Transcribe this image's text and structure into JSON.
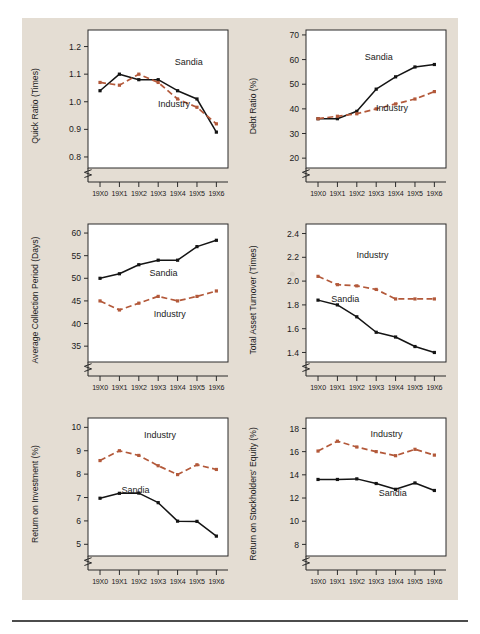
{
  "page": {
    "background_color": "#e4ddd3",
    "series_colors": {
      "sandia": "#141414",
      "industry": "#b3593a"
    },
    "series_names": {
      "sandia": "Sandia",
      "industry": "Industry"
    },
    "x_categories": [
      "19X0",
      "19X1",
      "19X2",
      "19X3",
      "19X4",
      "19X5",
      "19X6"
    ]
  },
  "chart_data": [
    {
      "id": "quick-ratio",
      "type": "line",
      "title": "",
      "xlabel": "",
      "ylabel": "Quick Ratio (Times)",
      "categories": [
        "19X0",
        "19X1",
        "19X2",
        "19X3",
        "19X4",
        "19X5",
        "19X6"
      ],
      "yticks": [
        0.8,
        0.9,
        1.0,
        1.1,
        1.2
      ],
      "ytick_labels": [
        "0.8",
        "0.9",
        "1.0",
        "1.1",
        "1.2"
      ],
      "ylim": [
        0.76,
        1.26
      ],
      "grid": false,
      "axis_break": true,
      "legend": "inline-annotation",
      "series": [
        {
          "name": "Sandia",
          "values": [
            1.04,
            1.1,
            1.08,
            1.08,
            1.04,
            1.01,
            0.89
          ]
        },
        {
          "name": "Industry",
          "values": [
            1.07,
            1.06,
            1.1,
            1.07,
            1.01,
            0.98,
            0.92
          ]
        }
      ]
    },
    {
      "id": "debt-ratio",
      "type": "line",
      "title": "",
      "xlabel": "",
      "ylabel": "Debt Ratio (%)",
      "categories": [
        "19X0",
        "19X1",
        "19X2",
        "19X3",
        "19X4",
        "19X5",
        "19X6"
      ],
      "yticks": [
        20,
        30,
        40,
        50,
        60,
        70
      ],
      "ytick_labels": [
        "20",
        "30",
        "40",
        "50",
        "60",
        "70"
      ],
      "ylim": [
        16,
        72
      ],
      "grid": false,
      "axis_break": true,
      "legend": "inline-annotation",
      "series": [
        {
          "name": "Sandia",
          "values": [
            36,
            36,
            39,
            48,
            53,
            57,
            58
          ]
        },
        {
          "name": "Industry",
          "values": [
            36,
            37,
            38,
            40,
            42,
            44,
            47
          ]
        }
      ]
    },
    {
      "id": "average-collection-period",
      "type": "line",
      "title": "",
      "xlabel": "",
      "ylabel": "Average Collection Period (Days)",
      "categories": [
        "19X0",
        "19X1",
        "19X2",
        "19X3",
        "19X4",
        "19X5",
        "19X6"
      ],
      "yticks": [
        35,
        40,
        45,
        50,
        55,
        60
      ],
      "ytick_labels": [
        "35",
        "40",
        "45",
        "50",
        "55",
        "60"
      ],
      "ylim": [
        31.5,
        62
      ],
      "grid": false,
      "axis_break": true,
      "legend": "inline-annotation",
      "series": [
        {
          "name": "Sandia",
          "values": [
            50,
            51,
            53,
            54,
            54,
            57,
            58.4
          ]
        },
        {
          "name": "Industry",
          "values": [
            45,
            43,
            44.5,
            46,
            45,
            46,
            47.2
          ]
        }
      ]
    },
    {
      "id": "total-asset-turnover",
      "type": "line",
      "title": "",
      "xlabel": "",
      "ylabel": "Total Asset Turnover (Times)",
      "categories": [
        "19X0",
        "19X1",
        "19X2",
        "19X3",
        "19X4",
        "19X5",
        "19X6"
      ],
      "yticks": [
        1.4,
        1.6,
        1.8,
        2.0,
        2.2,
        2.4
      ],
      "ytick_labels": [
        "1.4",
        "1.6",
        "1.8",
        "2.0",
        "2.2",
        "2.4"
      ],
      "ylim": [
        1.32,
        2.48
      ],
      "grid": false,
      "axis_break": true,
      "legend": "inline-annotation",
      "series": [
        {
          "name": "Sandia",
          "values": [
            1.84,
            1.8,
            1.7,
            1.57,
            1.53,
            1.45,
            1.4
          ]
        },
        {
          "name": "Industry",
          "values": [
            2.04,
            1.97,
            1.96,
            1.93,
            1.85,
            1.85,
            1.85
          ]
        }
      ]
    },
    {
      "id": "return-on-investment",
      "type": "line",
      "title": "",
      "xlabel": "",
      "ylabel": "Return on Investment (%)",
      "categories": [
        "19X0",
        "19X1",
        "19X2",
        "19X3",
        "19X4",
        "19X5",
        "19X6"
      ],
      "yticks": [
        5,
        6,
        7,
        8,
        9,
        10
      ],
      "ytick_labels": [
        "5",
        "6",
        "7",
        "8",
        "9",
        "10"
      ],
      "ylim": [
        4.5,
        10.4
      ],
      "grid": false,
      "axis_break": true,
      "legend": "inline-annotation",
      "series": [
        {
          "name": "Sandia",
          "values": [
            6.97,
            7.18,
            7.19,
            6.78,
            5.99,
            5.98,
            5.35
          ]
        },
        {
          "name": "Industry",
          "values": [
            8.58,
            9.0,
            8.8,
            8.36,
            7.98,
            8.4,
            8.2
          ]
        }
      ]
    },
    {
      "id": "return-on-stockholders-equity",
      "type": "line",
      "title": "",
      "xlabel": "",
      "ylabel": "Return on Stockholders' Equity (%)",
      "categories": [
        "19X0",
        "19X1",
        "19X2",
        "19X3",
        "19X4",
        "19X5",
        "19X6"
      ],
      "yticks": [
        8,
        10,
        12,
        14,
        16,
        18
      ],
      "ytick_labels": [
        "8",
        "10",
        "12",
        "14",
        "16",
        "18"
      ],
      "ylim": [
        7.0,
        18.9
      ],
      "grid": false,
      "axis_break": true,
      "legend": "inline-annotation",
      "series": [
        {
          "name": "Sandia",
          "values": [
            13.6,
            13.6,
            13.65,
            13.25,
            12.75,
            13.3,
            12.65
          ]
        },
        {
          "name": "Industry",
          "values": [
            16.05,
            16.9,
            16.4,
            16.0,
            15.65,
            16.2,
            15.7
          ]
        }
      ]
    }
  ]
}
